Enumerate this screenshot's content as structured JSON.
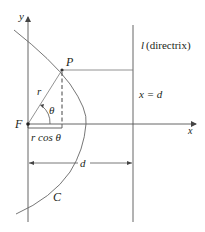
{
  "diagram": {
    "colors": {
      "stroke": "#555555",
      "text": "#231f20",
      "background": "#ffffff"
    },
    "axes": {
      "x_label": "x",
      "y_label": "y"
    },
    "points": {
      "focus_label": "F",
      "point_label": "P"
    },
    "segment_labels": {
      "radius": "r",
      "angle": "θ",
      "projection": "r cos θ",
      "distance": "d"
    },
    "directrix": {
      "name_label": "l",
      "name_suffix": "(directrix)",
      "equation": "x = d"
    },
    "curve_label": "C"
  }
}
